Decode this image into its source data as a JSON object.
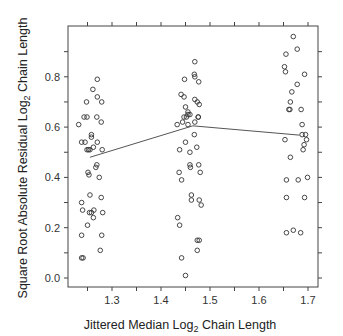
{
  "chart_data": {
    "type": "scatter",
    "title": "",
    "xlabel": "Jittered Median Log2 Chain Length",
    "ylabel": "Square Root Absolute Residual Log2 Chain Length",
    "xlabel_parts": {
      "pre": "Jittered Median Log",
      "sub": "2",
      "post": " Chain Length"
    },
    "ylabel_parts": {
      "pre": "Square Root Absolute Residual Log",
      "sub": "2",
      "post": " Chain Length"
    },
    "xlim": [
      1.21,
      1.725
    ],
    "ylim": [
      -0.045,
      0.98
    ],
    "x_ticks": [
      1.3,
      1.4,
      1.5,
      1.6,
      1.7
    ],
    "x_tick_labels": [
      "1.3",
      "1.4",
      "1.5",
      "1.6",
      "1.7"
    ],
    "y_ticks": [
      0.0,
      0.2,
      0.4,
      0.6,
      0.8
    ],
    "y_tick_labels": [
      "0.0",
      "0.2",
      "0.4",
      "0.6",
      "0.8"
    ],
    "grid": false,
    "legend": null,
    "marker": "open-circle",
    "series": [
      {
        "name": "residuals",
        "points": [
          [
            1.27,
            0.79
          ],
          [
            1.261,
            0.75
          ],
          [
            1.248,
            0.7
          ],
          [
            1.27,
            0.72
          ],
          [
            1.279,
            0.7
          ],
          [
            1.243,
            0.64
          ],
          [
            1.249,
            0.64
          ],
          [
            1.269,
            0.64
          ],
          [
            1.278,
            0.62
          ],
          [
            1.258,
            0.57
          ],
          [
            1.258,
            0.56
          ],
          [
            1.232,
            0.61
          ],
          [
            1.238,
            0.54
          ],
          [
            1.245,
            0.54
          ],
          [
            1.249,
            0.51
          ],
          [
            1.252,
            0.51
          ],
          [
            1.255,
            0.51
          ],
          [
            1.262,
            0.52
          ],
          [
            1.27,
            0.54
          ],
          [
            1.28,
            0.51
          ],
          [
            1.269,
            0.45
          ],
          [
            1.267,
            0.44
          ],
          [
            1.251,
            0.42
          ],
          [
            1.253,
            0.41
          ],
          [
            1.274,
            0.4
          ],
          [
            1.255,
            0.33
          ],
          [
            1.238,
            0.3
          ],
          [
            1.278,
            0.32
          ],
          [
            1.24,
            0.27
          ],
          [
            1.254,
            0.26
          ],
          [
            1.263,
            0.27
          ],
          [
            1.258,
            0.26
          ],
          [
            1.281,
            0.26
          ],
          [
            1.262,
            0.24
          ],
          [
            1.25,
            0.21
          ],
          [
            1.238,
            0.17
          ],
          [
            1.279,
            0.17
          ],
          [
            1.276,
            0.11
          ],
          [
            1.238,
            0.08
          ],
          [
            1.241,
            0.08
          ],
          [
            1.469,
            0.86
          ],
          [
            1.448,
            0.79
          ],
          [
            1.468,
            0.81
          ],
          [
            1.469,
            0.8
          ],
          [
            1.477,
            0.78
          ],
          [
            1.441,
            0.73
          ],
          [
            1.447,
            0.72
          ],
          [
            1.469,
            0.71
          ],
          [
            1.474,
            0.7
          ],
          [
            1.478,
            0.69
          ],
          [
            1.45,
            0.68
          ],
          [
            1.447,
            0.64
          ],
          [
            1.452,
            0.64
          ],
          [
            1.455,
            0.66
          ],
          [
            1.455,
            0.65
          ],
          [
            1.459,
            0.65
          ],
          [
            1.476,
            0.64
          ],
          [
            1.476,
            0.64
          ],
          [
            1.469,
            0.62
          ],
          [
            1.444,
            0.62
          ],
          [
            1.433,
            0.61
          ],
          [
            1.455,
            0.61
          ],
          [
            1.468,
            0.57
          ],
          [
            1.45,
            0.54
          ],
          [
            1.473,
            0.52
          ],
          [
            1.438,
            0.51
          ],
          [
            1.459,
            0.5
          ],
          [
            1.459,
            0.45
          ],
          [
            1.477,
            0.45
          ],
          [
            1.46,
            0.44
          ],
          [
            1.437,
            0.42
          ],
          [
            1.48,
            0.42
          ],
          [
            1.442,
            0.39
          ],
          [
            1.462,
            0.33
          ],
          [
            1.462,
            0.31
          ],
          [
            1.478,
            0.31
          ],
          [
            1.482,
            0.29
          ],
          [
            1.434,
            0.24
          ],
          [
            1.438,
            0.21
          ],
          [
            1.474,
            0.15
          ],
          [
            1.478,
            0.15
          ],
          [
            1.474,
            0.11
          ],
          [
            1.442,
            0.08
          ],
          [
            1.45,
            0.01
          ],
          [
            1.67,
            0.96
          ],
          [
            1.678,
            0.91
          ],
          [
            1.655,
            0.89
          ],
          [
            1.652,
            0.84
          ],
          [
            1.654,
            0.82
          ],
          [
            1.693,
            0.81
          ],
          [
            1.678,
            0.77
          ],
          [
            1.667,
            0.74
          ],
          [
            1.664,
            0.7
          ],
          [
            1.686,
            0.67
          ],
          [
            1.661,
            0.67
          ],
          [
            1.663,
            0.67
          ],
          [
            1.688,
            0.61
          ],
          [
            1.688,
            0.57
          ],
          [
            1.695,
            0.57
          ],
          [
            1.697,
            0.55
          ],
          [
            1.692,
            0.53
          ],
          [
            1.653,
            0.55
          ],
          [
            1.69,
            0.51
          ],
          [
            1.664,
            0.48
          ],
          [
            1.699,
            0.4
          ],
          [
            1.656,
            0.39
          ],
          [
            1.68,
            0.39
          ],
          [
            1.656,
            0.32
          ],
          [
            1.693,
            0.32
          ],
          [
            1.67,
            0.19
          ],
          [
            1.656,
            0.18
          ],
          [
            1.685,
            0.18
          ]
        ]
      }
    ],
    "smooth_line": {
      "name": "lowess",
      "points": [
        [
          1.255,
          0.48
        ],
        [
          1.465,
          0.605
        ],
        [
          1.683,
          0.568
        ]
      ]
    }
  }
}
